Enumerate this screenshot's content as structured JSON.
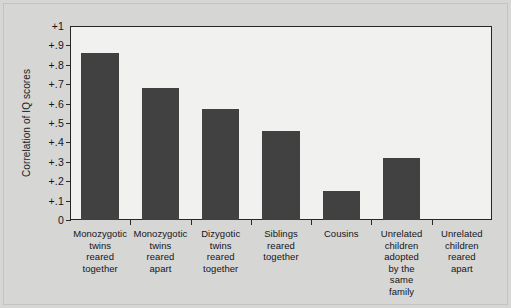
{
  "chart_data": {
    "type": "bar",
    "title": "",
    "xlabel": "",
    "ylabel": "Correlation of IQ scores",
    "ylim": [
      0,
      1
    ],
    "grid": false,
    "legend": "none",
    "categories": [
      "Monozygotic twins reared together",
      "Monozygotic twins reared apart",
      "Dizygotic twins reared together",
      "Siblings reared together",
      "Cousins",
      "Unrelated children adopted by the same family",
      "Unrelated children reared apart"
    ],
    "category_lines": [
      "Monozygotic\ntwins\nreared\ntogether",
      "Monozygotic\ntwins\nreared\napart",
      "Dizygotic\ntwins\nreared\ntogether",
      "Siblings\nreared\ntogether",
      "Cousins",
      "Unrelated\nchildren\nadopted\nby the\nsame\nfamily",
      "Unrelated\nchildren\nreared\napart"
    ],
    "values": [
      0.86,
      0.68,
      0.57,
      0.46,
      0.15,
      0.32,
      0.0
    ],
    "ytick_values": [
      1,
      0.9,
      0.8,
      0.7,
      0.6,
      0.5,
      0.4,
      0.3,
      0.2,
      0.1,
      0
    ],
    "ytick_labels": [
      "+1",
      "+.9",
      "+.8",
      "+.7",
      "+.6",
      "+.5",
      "+.4",
      "+.3",
      "+.2",
      "+.1",
      "0"
    ],
    "bar_color": "#414141",
    "plot_background": "#f1f1ef",
    "figure_background": "#d6d6d4",
    "axis_color": "#262626"
  }
}
